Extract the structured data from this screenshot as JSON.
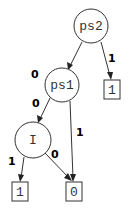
{
  "diagram": {
    "type": "binary-decision-diagram",
    "nodes": [
      {
        "id": "ps2",
        "label": "ps2",
        "shape": "circle"
      },
      {
        "id": "ps1",
        "label": "ps1",
        "shape": "circle"
      },
      {
        "id": "I",
        "label": "I",
        "shape": "circle"
      },
      {
        "id": "t1_right",
        "label": "1",
        "shape": "box"
      },
      {
        "id": "t1_left",
        "label": "1",
        "shape": "box"
      },
      {
        "id": "t0",
        "label": "0",
        "shape": "box"
      }
    ],
    "edges": [
      {
        "from": "ps2",
        "to": "ps1",
        "label": "0"
      },
      {
        "from": "ps2",
        "to": "t1_right",
        "label": "1"
      },
      {
        "from": "ps1",
        "to": "I",
        "label": "0"
      },
      {
        "from": "ps1",
        "to": "t0",
        "label": "1"
      },
      {
        "from": "I",
        "to": "t1_left",
        "label": "1"
      },
      {
        "from": "I",
        "to": "t0",
        "label": "0"
      }
    ]
  }
}
